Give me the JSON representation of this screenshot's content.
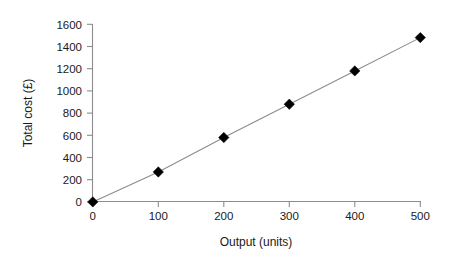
{
  "chart_data": {
    "type": "line",
    "title": "",
    "xlabel": "Output (units)",
    "ylabel": "Total cost (£)",
    "x": [
      0,
      100,
      200,
      300,
      400,
      500
    ],
    "values": [
      0,
      270,
      580,
      880,
      1180,
      1480
    ],
    "series": [
      {
        "name": "Total cost",
        "values": [
          0,
          270,
          580,
          880,
          1180,
          1480
        ]
      }
    ],
    "xlim": [
      0,
      500
    ],
    "ylim": [
      0,
      1600
    ],
    "xticks": [
      "0",
      "100",
      "200",
      "300",
      "400",
      "500"
    ],
    "yticks": [
      "0",
      "200",
      "400",
      "600",
      "800",
      "1000",
      "1200",
      "1400",
      "1600"
    ],
    "grid": false,
    "legend": false,
    "marker": "diamond",
    "marker_color": "#000000",
    "line_color": "#8c8c8c",
    "axis_color": "#8c8c8c",
    "background": "#ffffff"
  },
  "axes": {
    "x_title": "Output (units)",
    "y_title": "Total cost (£)",
    "x_tick_labels": [
      "0",
      "100",
      "200",
      "300",
      "400",
      "500"
    ],
    "y_tick_labels": [
      "0",
      "200",
      "400",
      "600",
      "800",
      "1000",
      "1200",
      "1400",
      "1600"
    ]
  }
}
